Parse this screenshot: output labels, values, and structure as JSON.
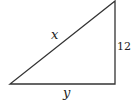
{
  "diagram": {
    "type": "right-triangle",
    "stroke_color": "#333333",
    "vertices": {
      "bottom_left": [
        10,
        84
      ],
      "bottom_right": [
        115,
        84
      ],
      "top_right": [
        115,
        1
      ]
    },
    "labels": {
      "hypotenuse": "x",
      "vertical_leg": "12",
      "horizontal_leg": "y"
    }
  }
}
